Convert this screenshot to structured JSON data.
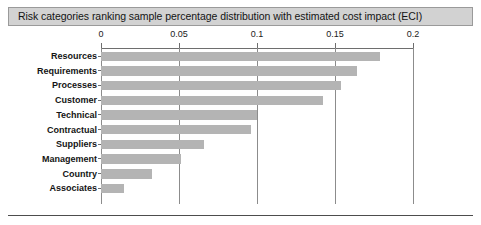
{
  "figure": {
    "title": "Risk categories ranking sample percentage distribution with estimated cost impact (ECI)",
    "title_band_color": "#d2d2d2",
    "bar_color": "#b4b4b4",
    "axis_color": "#6e6e6e",
    "background": "#ffffff"
  },
  "chart_data": {
    "type": "bar",
    "orientation": "horizontal",
    "title": "Risk categories ranking sample percentage distribution with estimated cost impact (ECI)",
    "xlabel": "",
    "ylabel": "",
    "xlim": [
      0,
      0.2
    ],
    "xticks": [
      "0",
      "0.05",
      "0.1",
      "0.15",
      "0.2"
    ],
    "xtick_values": [
      0,
      0.05,
      0.1,
      0.15,
      0.2
    ],
    "grid": "vertical",
    "legend": "none",
    "categories": [
      "Resources",
      "Requirements",
      "Processes",
      "Customer",
      "Technical",
      "Contractual",
      "Suppliers",
      "Management",
      "Country",
      "Associates"
    ],
    "values": [
      0.179,
      0.164,
      0.154,
      0.142,
      0.1,
      0.096,
      0.066,
      0.051,
      0.033,
      0.015
    ]
  }
}
